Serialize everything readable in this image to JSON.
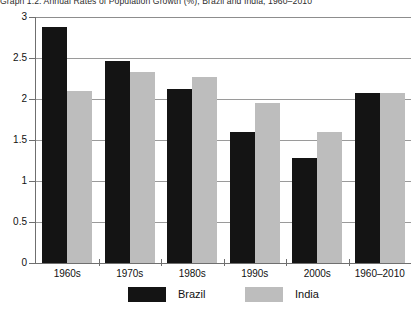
{
  "figure": {
    "caption_number": "Graph 1.2:",
    "caption_text": "Annual Rates of Population Growth (%), Brazil and India, 1960–2010",
    "caption_full": "Graph 1.2: Annual Rates of Population Growth (%), Brazil and India, 1960–2010"
  },
  "colors": {
    "brazil": "#141414",
    "india": "#bdbdbd",
    "grid": "#9a9a9a",
    "axis": "#6f6f6f",
    "background": "#ffffff",
    "text": "#111111"
  },
  "chart_data": {
    "type": "bar",
    "title": "Graph 1.2: Annual Rates of Population Growth (%), Brazil and India, 1960–2010",
    "xlabel": "",
    "ylabel": "",
    "categories": [
      "1960s",
      "1970s",
      "1980s",
      "1990s",
      "2000s",
      "1960–2010"
    ],
    "series": [
      {
        "name": "Brazil",
        "color": "#141414",
        "values": [
          2.88,
          2.46,
          2.12,
          1.6,
          1.28,
          2.07
        ]
      },
      {
        "name": "India",
        "color": "#bdbdbd",
        "values": [
          2.1,
          2.33,
          2.27,
          1.95,
          1.6,
          2.07
        ]
      }
    ],
    "ylim": [
      0,
      3
    ],
    "yticks": [
      0,
      0.5,
      1,
      1.5,
      2,
      2.5,
      3
    ],
    "ytick_labels": [
      "0",
      "0.5",
      "1",
      "1.5",
      "2",
      "2.5",
      "3"
    ],
    "grid": true,
    "grid_axis": "y",
    "legend": [
      "Brazil",
      "India"
    ],
    "legend_position": "bottom"
  }
}
